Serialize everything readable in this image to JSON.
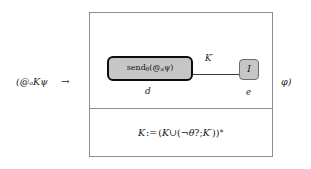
{
  "figure": {
    "kind": "logic-diagram",
    "antecedent": "(@ₐKψ",
    "implication_symbol": "→",
    "consequent_close": "φ)",
    "program_box": {
      "graph": {
        "nodes": [
          {
            "id": "send-node",
            "label": "sendθ(@ₐψ)",
            "sub_label": "d",
            "shape": "rounded-rect",
            "fill": "#c6c6c6",
            "border": "#0c0c0c",
            "emphasis": "thick"
          },
          {
            "id": "i-node",
            "label": "I",
            "sub_label": "e",
            "shape": "rounded-rect",
            "fill": "#c6c6c6",
            "border": "#6e6e6e",
            "emphasis": "thin"
          }
        ],
        "edges": [
          {
            "from": "send-node",
            "to": "i-node",
            "label": "K′"
          }
        ]
      },
      "assignment": "K := (K ∪ (¬θ?; K′))*"
    },
    "colors": {
      "box_border": "#8d8d8d",
      "node_fill": "#c6c6c6",
      "node_border_strong": "#0c0c0c",
      "node_border_weak": "#6e6e6e",
      "edge": "#3a3a3a",
      "text": "#1a1a1a",
      "background": "#ffffff"
    }
  }
}
